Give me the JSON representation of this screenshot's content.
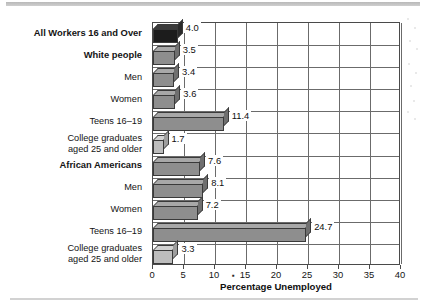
{
  "chart_data": {
    "type": "bar",
    "orientation": "horizontal",
    "title": "",
    "xlabel": "Percentage Unemployed",
    "ylabel": "",
    "xlim": [
      0,
      40
    ],
    "xticks": [
      0,
      5,
      10,
      15,
      20,
      25,
      30,
      35,
      40
    ],
    "xtick_labels": [
      "0",
      "5",
      "10",
      "15",
      "20",
      "25",
      "30",
      "35",
      "40"
    ],
    "grid": "vertical-and-horizontal",
    "legend": "none",
    "categories": [
      "All Workers 16 and Over",
      "White people",
      "Men",
      "Women",
      "Teens 16–19",
      "College graduates\naged 25 and older",
      "African Americans",
      "Men",
      "Women",
      "Teens 16–19",
      "College graduates\naged 25 and older"
    ],
    "values": [
      4.0,
      3.5,
      3.4,
      3.6,
      11.4,
      1.7,
      7.6,
      8.1,
      7.2,
      24.7,
      3.3
    ],
    "data_labels": [
      "4.0",
      "3.5",
      "3.4",
      "3.6",
      "11.4",
      "1.7",
      "7.6",
      "8.1",
      "7.2",
      "24.7",
      "3.3"
    ],
    "bar_styles": [
      "dark",
      "mid",
      "mid",
      "mid",
      "mid",
      "light",
      "mid",
      "mid",
      "mid",
      "mid",
      "light"
    ],
    "label_emphasis": [
      "bold",
      "bold",
      "normal",
      "normal",
      "normal",
      "normal",
      "bold",
      "normal",
      "normal",
      "normal",
      "normal"
    ],
    "colors": {
      "bar_dark": "#1c1c1c",
      "bar_mid": "#8e8e8e",
      "bar_light": "#bdbdbd",
      "grid": "#6b6b6b",
      "axis": "#4a4a4a",
      "text": "#141414",
      "background": "#ffffff",
      "page_rule": "#cfcfcf"
    }
  },
  "artifacts": {
    "tick_15_speck": "▪"
  }
}
